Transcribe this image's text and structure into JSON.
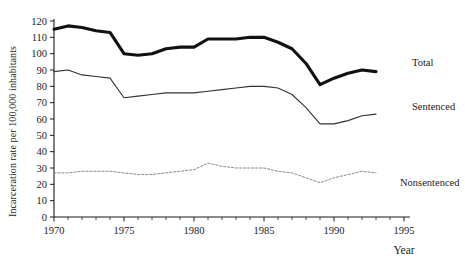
{
  "chart_data": {
    "type": "line",
    "title": "",
    "xlabel": "Year",
    "ylabel": "Incarceration rate per 100,000 inhabitants",
    "xlim": [
      1970,
      1995
    ],
    "ylim": [
      0,
      120
    ],
    "ytick_step": 10,
    "xtick_step": 5,
    "x_minor_ticks": true,
    "grid": false,
    "legend_position": "right-inline-labels",
    "x": [
      1970,
      1971,
      1972,
      1973,
      1974,
      1975,
      1976,
      1977,
      1978,
      1979,
      1980,
      1981,
      1982,
      1983,
      1984,
      1985,
      1986,
      1987,
      1988,
      1989,
      1990,
      1991,
      1992,
      1993
    ],
    "series": [
      {
        "name": "Total",
        "style": "thick-solid",
        "color": "#111111",
        "values": [
          115,
          117,
          116,
          114,
          113,
          100,
          99,
          100,
          103,
          104,
          104,
          109,
          109,
          109,
          110,
          110,
          107,
          103,
          94,
          81,
          85,
          88,
          90,
          89
        ]
      },
      {
        "name": "Sentenced",
        "style": "thin-solid",
        "color": "#333333",
        "values": [
          89,
          90,
          87,
          86,
          85,
          73,
          74,
          75,
          76,
          76,
          76,
          77,
          78,
          79,
          80,
          80,
          79,
          75,
          67,
          57,
          57,
          59,
          62,
          63
        ]
      },
      {
        "name": "Nonsentenced",
        "style": "dotted",
        "color": "#8a8a8a",
        "values": [
          27,
          27,
          28,
          28,
          28,
          27,
          26,
          26,
          27,
          28,
          29,
          33,
          31,
          30,
          30,
          30,
          28,
          27,
          24,
          21,
          24,
          26,
          28,
          27
        ]
      }
    ],
    "ytick_labels": [
      "0",
      "10",
      "20",
      "30",
      "40",
      "50",
      "60",
      "70",
      "80",
      "90",
      "100",
      "110",
      "120"
    ],
    "xtick_labels": [
      "1970",
      "1975",
      "1980",
      "1985",
      "1990",
      "1995"
    ],
    "annotations": [
      {
        "text": "Total",
        "for": "Total"
      },
      {
        "text": "Sentenced",
        "for": "Sentenced"
      },
      {
        "text": "Nonsentenced",
        "for": "Nonsentenced"
      }
    ]
  }
}
